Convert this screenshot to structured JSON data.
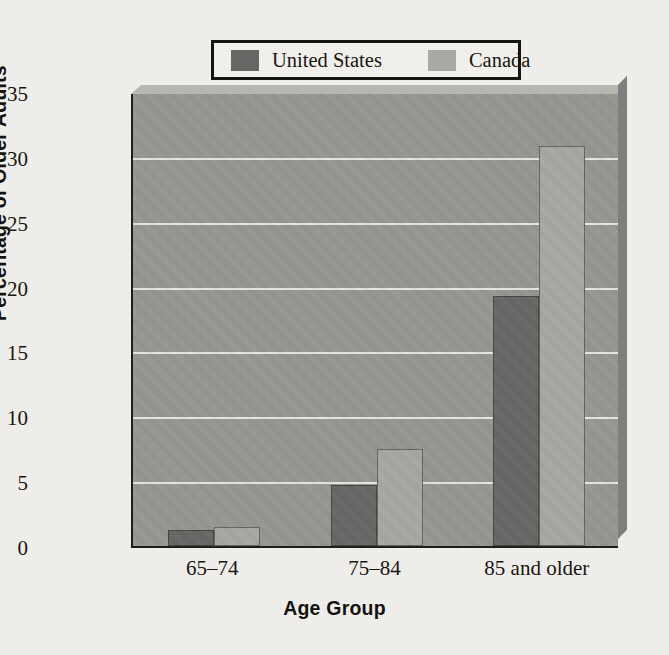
{
  "chart_data": {
    "type": "bar",
    "title": "",
    "subtitle": "",
    "categories": [
      "65–74",
      "75–84",
      "85 and older"
    ],
    "series": [
      {
        "name": "United States",
        "values": [
          1.2,
          4.7,
          19.3
        ],
        "color": "#656563"
      },
      {
        "name": "Canada",
        "values": [
          1.5,
          7.5,
          30.8
        ],
        "color": "#aaa9a4"
      }
    ],
    "xlabel": "Age Group",
    "ylabel": "Percentage of Older Adults",
    "ylim": [
      0,
      35
    ],
    "yticks": [
      0,
      5,
      10,
      15,
      20,
      25,
      30,
      35
    ],
    "ytick_labels": [
      "0",
      "5",
      "10",
      "15",
      "20",
      "25",
      "30",
      "35"
    ],
    "grid": "horizontal",
    "legend_position": "top-center",
    "plot_background_color": "#999792",
    "gridline_color": "#eceae4",
    "page_background_color": "#f1f0ec",
    "axis_color": "#1b1b1b"
  },
  "legend": {
    "entries": [
      {
        "label": "United States",
        "swatch": "#656563"
      },
      {
        "label": "Canada",
        "swatch": "#aaa9a4"
      }
    ]
  }
}
